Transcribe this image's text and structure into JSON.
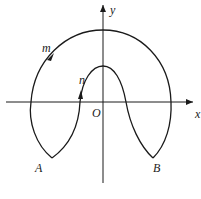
{
  "labels": {
    "y_axis": "y",
    "x_axis": "x",
    "origin": "O",
    "outer_path": "m",
    "inner_path": "n",
    "point_a": "A",
    "point_b": "B"
  },
  "colors": {
    "stroke": "#1a1a1a",
    "background": "#ffffff"
  }
}
